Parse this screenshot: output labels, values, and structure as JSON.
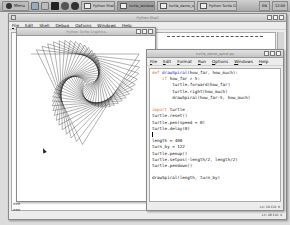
{
  "taskbar": {
    "menu_label": "Menu",
    "launchers": [
      {
        "icon": "files-icon",
        "color": "#9ab"
      },
      {
        "icon": "editor-icon",
        "color": "#bbb"
      },
      {
        "icon": "terminal-icon",
        "color": "#222"
      },
      {
        "icon": "settings-icon",
        "color": "#555"
      },
      {
        "icon": "browser-icon",
        "color": "#333"
      }
    ],
    "tasks": [
      {
        "label": "Python Shell",
        "active": false
      },
      {
        "label": "turtle_window.. (Demo)",
        "active": true
      },
      {
        "label": "turtle_demo_spiral.py",
        "active": false
      },
      {
        "label": "Python Turtle Graphics",
        "active": false
      }
    ],
    "tray": [
      "EN",
      "12:00"
    ]
  },
  "shell_window": {
    "title": "Python Shell",
    "menu": [
      "File",
      "Edit",
      "Shell",
      "Debug",
      "Options",
      "Windows",
      "Help"
    ],
    "prompts": [
      ">>>",
      ">>>"
    ],
    "status": "Ln: 48 Col: 4"
  },
  "turtle_window": {
    "title": "Python Turtle Graphics"
  },
  "editor_window": {
    "title": "turtle_demo_spiral.py",
    "menu": [
      "File",
      "Edit",
      "Format",
      "Run",
      "Options",
      "Windows",
      "Help"
    ],
    "code_lines": [
      {
        "kw": "def ",
        "fn": "drawSpiral",
        "rest": "(how_far, how_much):"
      },
      {
        "kw": "    if ",
        "fn": "",
        "rest": "how_far > 5:"
      },
      {
        "kw": "",
        "fn": "",
        "rest": "        turtle.forward(how_far)"
      },
      {
        "kw": "",
        "fn": "",
        "rest": "        turtle.right(how_much)"
      },
      {
        "kw": "",
        "fn": "",
        "rest": "        drawSpiral(how_far-5, how_much)"
      },
      {
        "kw": "",
        "fn": "",
        "rest": ""
      },
      {
        "kw": "import ",
        "fn": "",
        "rest": "turtle"
      },
      {
        "kw": "",
        "fn": "",
        "rest": "turtle.reset()"
      },
      {
        "kw": "",
        "fn": "",
        "rest": "turtle.pen(speed = 0)"
      },
      {
        "kw": "",
        "fn": "",
        "rest": "turtle.delay(0)"
      },
      {
        "kw": "",
        "fn": "",
        "rest": ""
      },
      {
        "kw": "",
        "fn": "",
        "rest": "length = 400"
      },
      {
        "kw": "",
        "fn": "",
        "rest": "turn_by = 122"
      },
      {
        "kw": "",
        "fn": "",
        "rest": "turtle.penup()"
      },
      {
        "kw": "",
        "fn": "",
        "rest": "turtle.setpos(-length/2, length/2)"
      },
      {
        "kw": "",
        "fn": "",
        "rest": "turtle.pendown()"
      },
      {
        "kw": "",
        "fn": "",
        "rest": ""
      },
      {
        "kw": "",
        "fn": "",
        "rest": "drawSpiral(length, turn_by)"
      }
    ],
    "status": "Ln: 10 Col: 0"
  }
}
